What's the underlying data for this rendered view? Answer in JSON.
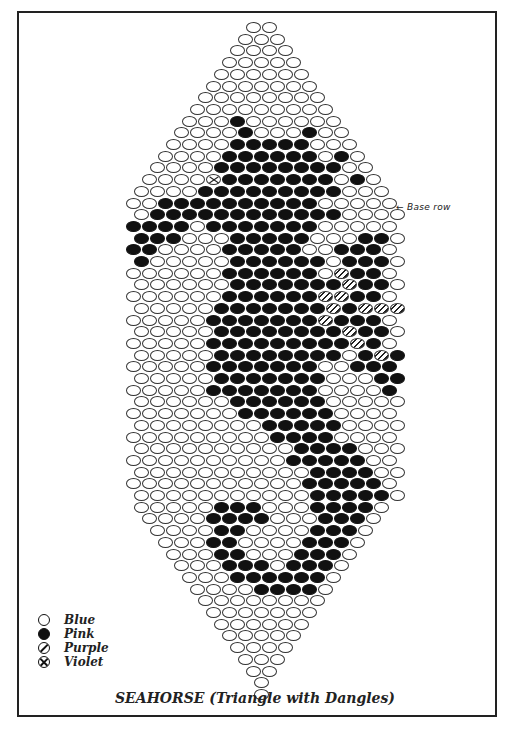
{
  "title": "SEAHORSE (Triangle with Dangles)",
  "annotation": "← Base row",
  "legend": [
    {
      "symbol": "open-circle",
      "key": "blue",
      "label": "Blue"
    },
    {
      "symbol": "filled-circle",
      "key": "pink",
      "label": "Pink"
    },
    {
      "symbol": "slashed-circle",
      "key": "purple",
      "label": "Purple"
    },
    {
      "symbol": "crossed-circle",
      "key": "violet",
      "label": "Violet"
    }
  ],
  "colors": {
    "outline": "#333333",
    "fill_dark": "#111111",
    "paper": "#ffffff"
  },
  "grid": {
    "bead_w": 16,
    "row_h": 11.7,
    "top_y": 22,
    "center_x": 262,
    "note": "Each row: [width_in_beads, run-length string]. Codes: B=blue, P=pink, U=purple, V=violet. Runs like 'B5P3' expand to beads.",
    "rows": [
      [
        2,
        "B2"
      ],
      [
        3,
        "B3"
      ],
      [
        4,
        "B4"
      ],
      [
        5,
        "B5"
      ],
      [
        6,
        "B6"
      ],
      [
        7,
        "B7"
      ],
      [
        8,
        "B8"
      ],
      [
        9,
        "B9"
      ],
      [
        10,
        "B3P1B6"
      ],
      [
        11,
        "B4P1B3P1B2"
      ],
      [
        12,
        "B4P5B3"
      ],
      [
        13,
        "B4P6B1P1B1"
      ],
      [
        14,
        "B4P8B2"
      ],
      [
        15,
        "B4V1P7B1P1B1"
      ],
      [
        16,
        "B4P9B3"
      ],
      [
        17,
        "B2P10B5"
      ],
      [
        17,
        "B1P12B4"
      ],
      [
        17,
        "P4B1P7B5"
      ],
      [
        17,
        "P3B3P5B3P2B1"
      ],
      [
        17,
        "P2B4P5B2P3B1"
      ],
      [
        17,
        "P1B5P6B1P3B1"
      ],
      [
        17,
        "B6P6B1U1P2B1"
      ],
      [
        17,
        "B6P7U1P2B1"
      ],
      [
        17,
        "B6P6U2P2B1"
      ],
      [
        17,
        "B5P7U1P1U3B0"
      ],
      [
        17,
        "B5P7U1P3B1"
      ],
      [
        17,
        "B5P8U1P2B1"
      ],
      [
        17,
        "B5P9U1P1B1"
      ],
      [
        17,
        "B5P8B1P1U1P1B0"
      ],
      [
        17,
        "B5P7B2P3B0"
      ],
      [
        17,
        "B5P7B3P2B0"
      ],
      [
        17,
        "B5P7B4P1B0"
      ],
      [
        17,
        "B6P6B5"
      ],
      [
        17,
        "B7P6B4"
      ],
      [
        17,
        "B8P5B4"
      ],
      [
        17,
        "B9P4B4"
      ],
      [
        17,
        "B10P4B3"
      ],
      [
        17,
        "B10P5B2"
      ],
      [
        17,
        "B11P4B2"
      ],
      [
        17,
        "B11P5B1"
      ],
      [
        17,
        "B11P5B1"
      ],
      [
        16,
        "B5P3B3P4B1"
      ],
      [
        15,
        "B4P4B3P3B1"
      ],
      [
        14,
        "B4P2B4P3B1"
      ],
      [
        13,
        "B3P2B4P3B1"
      ],
      [
        12,
        "B3P2B3P3B1"
      ],
      [
        11,
        "B3P3B1P3B1"
      ],
      [
        10,
        "B3P6B1"
      ],
      [
        9,
        "B4P4B1"
      ],
      [
        8,
        "B8"
      ],
      [
        7,
        "B7"
      ],
      [
        6,
        "B6"
      ],
      [
        5,
        "B5"
      ],
      [
        4,
        "B4"
      ],
      [
        3,
        "B3"
      ],
      [
        2,
        "B2"
      ],
      [
        1,
        "B1"
      ],
      [
        1,
        "B1"
      ]
    ],
    "base_row_index": 16
  }
}
